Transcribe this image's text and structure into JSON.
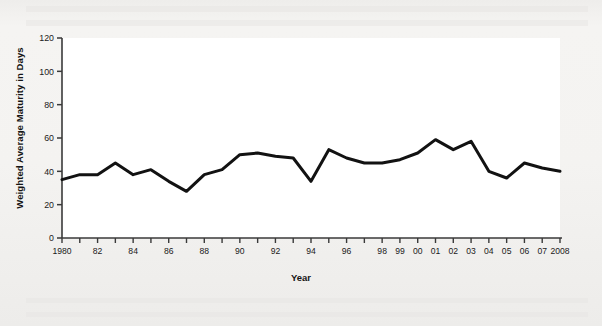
{
  "chart_data": {
    "type": "line",
    "title": "",
    "xlabel": "Year",
    "ylabel": "Weighted Average Maturity in Days",
    "x": [
      1980,
      1981,
      1982,
      1983,
      1984,
      1985,
      1986,
      1987,
      1988,
      1989,
      1990,
      1991,
      1992,
      1993,
      1994,
      1995,
      1996,
      1997,
      1998,
      1999,
      2000,
      2001,
      2002,
      2003,
      2004,
      2005,
      2006,
      2007,
      2008
    ],
    "values": [
      35,
      38,
      38,
      45,
      38,
      41,
      34,
      28,
      38,
      41,
      50,
      51,
      49,
      48,
      34,
      53,
      48,
      45,
      45,
      47,
      51,
      59,
      53,
      58,
      40,
      36,
      45,
      42,
      40
    ],
    "xtick_labels": [
      "1980",
      "",
      "82",
      "",
      "84",
      "",
      "86",
      "",
      "88",
      "",
      "90",
      "",
      "92",
      "",
      "94",
      "",
      "96",
      "",
      "98",
      "99",
      "00",
      "01",
      "02",
      "03",
      "04",
      "05",
      "06",
      "07",
      "2008"
    ],
    "ytick_labels": [
      "0",
      "20",
      "40",
      "60",
      "80",
      "100",
      "120"
    ],
    "ytick_values": [
      0,
      20,
      40,
      60,
      80,
      100,
      120
    ],
    "ylim": [
      0,
      120
    ],
    "xlim": [
      1980,
      2008
    ],
    "grid": false,
    "legend": null,
    "series_color": "#121212",
    "line_width": 3,
    "plot_background": "#ffffff",
    "page_background": "#f3f3f1"
  }
}
